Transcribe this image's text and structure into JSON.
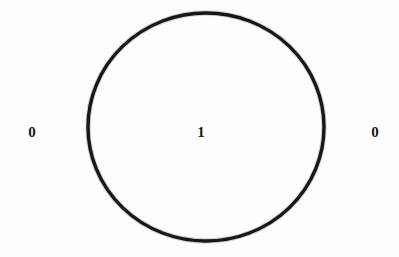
{
  "figure": {
    "kind": "jordan-curve-winding-number-diagram",
    "background_color": "#fdfdfd",
    "width": 399,
    "height": 257
  },
  "curve": {
    "name": "closed-curve",
    "shape": "circle",
    "stroke_color": "#17171a",
    "stroke_width": 3.4,
    "fill": "none",
    "center_x": 206,
    "center_y": 127,
    "radius_x": 118,
    "radius_y": 114
  },
  "labels": {
    "outer_left": {
      "text": "0",
      "color": "#17171a",
      "region": "exterior"
    },
    "inner": {
      "text": "1",
      "color": "#17171a",
      "region": "interior"
    },
    "outer_right": {
      "text": "0",
      "color": "#17171a",
      "region": "exterior"
    }
  },
  "chart_data": {
    "type": "diagram",
    "title": "",
    "xlabel": "",
    "ylabel": "",
    "regions": [
      {
        "name": "exterior-left",
        "label": "0",
        "x": 31,
        "y": 133
      },
      {
        "name": "interior",
        "label": "1",
        "x": 201,
        "y": 133
      },
      {
        "name": "exterior-right",
        "label": "0",
        "x": 375,
        "y": 133
      }
    ],
    "curves": [
      {
        "name": "closed-curve",
        "type": "circle",
        "center": [
          206,
          127
        ],
        "radius": [
          118,
          114
        ],
        "stroke": "#17171a",
        "stroke_width": 3.4
      }
    ],
    "values": [
      0,
      1,
      0
    ],
    "categories": [
      "exterior-left",
      "interior",
      "exterior-right"
    ],
    "grid": false,
    "legend": "none"
  }
}
